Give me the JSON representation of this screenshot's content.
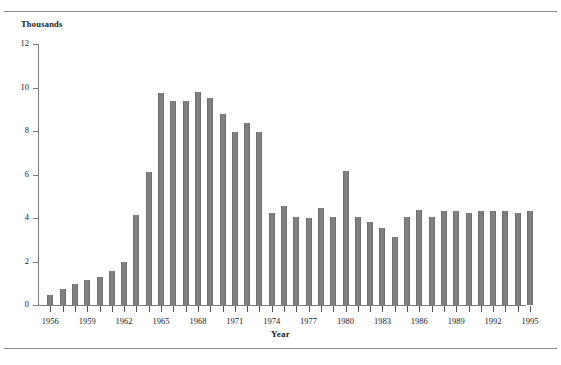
{
  "figure": {
    "clipped_title_fragment": "",
    "y_unit_label": "Thousands",
    "x_axis_title": "Year"
  },
  "colors": {
    "bar_fill": "#808080",
    "bar_edge": "#6e6e6e",
    "axis": "#7d7d7d",
    "rule": "#8a8a8a",
    "text": "#1a1a1a",
    "background": "#ffffff"
  },
  "chart_data": {
    "type": "bar",
    "title": "",
    "subtitle": "",
    "xlabel": "Year",
    "ylabel": "Thousands",
    "ylim": [
      0,
      12
    ],
    "ytick_values": [
      0,
      2,
      4,
      6,
      8,
      10,
      12
    ],
    "ytick_labels": [
      "0",
      "2",
      "4",
      "6",
      "8",
      "10",
      "12"
    ],
    "xlim": [
      1955.5,
      1995.5
    ],
    "xtick_labels": [
      "1956",
      "1959",
      "1962",
      "1965",
      "1968",
      "1971",
      "1974",
      "1977",
      "1980",
      "1983",
      "1986",
      "1989",
      "1992",
      "1995"
    ],
    "xtick_interval_years": 3,
    "grid": false,
    "legend": null,
    "categories": [
      "1956",
      "1957",
      "1958",
      "1959",
      "1960",
      "1961",
      "1962",
      "1963",
      "1964",
      "1965",
      "1966",
      "1967",
      "1968",
      "1969",
      "1970",
      "1971",
      "1972",
      "1973",
      "1974",
      "1975",
      "1976",
      "1977",
      "1978",
      "1979",
      "1980",
      "1981",
      "1982",
      "1983",
      "1984",
      "1985",
      "1986",
      "1987",
      "1988",
      "1989",
      "1990",
      "1991",
      "1992",
      "1993",
      "1994",
      "1995"
    ],
    "values": [
      0.45,
      0.75,
      0.95,
      1.15,
      1.3,
      1.55,
      2.0,
      4.15,
      6.1,
      9.75,
      9.4,
      9.4,
      9.8,
      9.5,
      8.8,
      7.95,
      8.35,
      7.95,
      4.25,
      4.55,
      4.05,
      4.0,
      4.45,
      4.05,
      6.15,
      4.05,
      3.8,
      3.55,
      3.15,
      4.05,
      4.35,
      4.05,
      4.3,
      4.3,
      4.25,
      4.3,
      4.3,
      4.3,
      4.25,
      4.3
    ]
  }
}
